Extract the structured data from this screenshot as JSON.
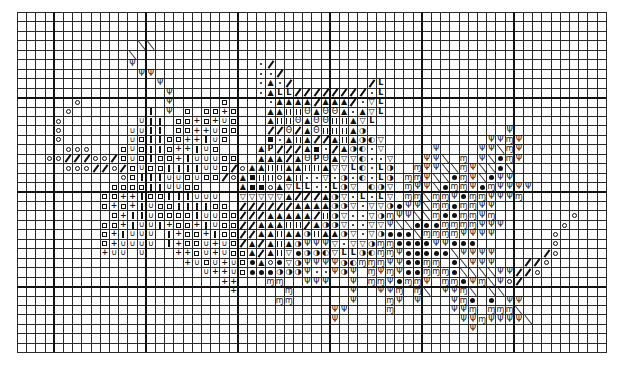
{
  "chart": {
    "title": "",
    "grid": {
      "cols": 64,
      "rows": 36,
      "cell_width": 9.2,
      "cell_height": 9.45,
      "thick_cols": [
        4,
        14,
        24,
        34,
        44,
        54
      ],
      "thick_rows": [
        9,
        19,
        29
      ],
      "line_color": "#2a2a2a",
      "thick_line_color": "#111111",
      "background": "#ffffff"
    },
    "legend": {
      "o": {
        "name": "open-circle",
        "glyph": "",
        "shape": "circle"
      },
      "/": {
        "name": "thick-slash",
        "glyph": "",
        "shape": "slash"
      },
      "x": {
        "name": "back-stitch-diagonal",
        "glyph": "",
        "shape": "bslash"
      },
      "v": {
        "name": "psi-arrow",
        "glyph": "Ψ"
      },
      "q": {
        "name": "open-square",
        "glyph": "",
        "shape": "square"
      },
      "+": {
        "name": "plus",
        "glyph": "+"
      },
      "|": {
        "name": "vertical-bar",
        "glyph": "",
        "shape": "bar"
      },
      "u": {
        "name": "cup-u",
        "glyph": "∪"
      },
      "a": {
        "name": "filled-triangle",
        "glyph": "▲"
      },
      "t": {
        "name": "open-triangle-down",
        "glyph": "▽"
      },
      "L": {
        "name": "corner-l",
        "glyph": "L"
      },
      "d": {
        "name": "dot",
        "glyph": "",
        "shape": "dot"
      },
      "h": {
        "name": "double-bar",
        "glyph": "",
        "shape": "double"
      },
      "O": {
        "name": "ringed-o",
        "glyph": "Θ"
      },
      "s": {
        "name": "filled-square",
        "glyph": "",
        "shape": "fsquare"
      },
      "p": {
        "name": "letter-p",
        "glyph": "P"
      },
      "b": {
        "name": "half-circle-right",
        "glyph": "◑"
      },
      "e": {
        "name": "half-circle-left",
        "glyph": "◐"
      },
      "m": {
        "name": "curly-m",
        "glyph": "ɱ"
      },
      "k": {
        "name": "filled-circle",
        "glyph": "",
        "shape": "fcircle"
      }
    },
    "rows": {
      "3": "13x 14x",
      "4": "12x",
      "5": "12v 26d 27/",
      "6": "13v 14v 26d 27d 28/",
      "7": "15v 26d 27a 28d 29/ 38/ 39L",
      "8": "16v 26d 27a 28L 29L 30/ 31/ 32/ 33/ 34/ 35/ 36/ 37/ 38d 39L",
      "9": "6o 16v 22q 27d 28a 29a 30a 31a 32/ 33a 34a 35a 36/ 37d 38t 39L",
      "10": "5o 14| 16v 18q 20q 21q 22+ 23q 27a 28a 29h 30h 31O 32a 33O 34O 35a 36d 37a 38t 39L",
      "11": "4o 13u 14| 15| 17q 18q 19+ 20q 21+ 22u 23q 27a 28h 29h 30O 31a 32O 33O 34h 35h 36a 37t 38L",
      "12": "4o 12u 13u 14| 15| 17q 18q 19+ 20+ 21u 22q 23q 27/ 28/ 29O 30/ 31a 32O 33h 34h 35h 36a 37b 53v",
      "13": "4o 12u 13q 14| 15| 16q 17q 18+ 19+ 20| 21u 22q 27s 28d 29a 30h 31a 32/ 33/ 34a 35h 36a 37b 38e 39t 51v 52v 53m 54v",
      "14": "5o 6o 7o 11q 12u 13q 14| 15| 16q 17+ 18+ 19| 20u 21q 26a 27p 28/ 29/ 30/ 31a 32s 33d 34/ 35a 36b 37e 38d 39t 45v 50v 51v 52x 53m 54v",
      "15": "3o 4o 5/ 6/ 7/ 8o 9o 10/ 11q 12u 13q 14| 15q 16q 17+ 18| 19u 20u 21u 22q 23q 26a 27a 28a 29/ 30a 31O 32p 33O 34a 35t 36t 37e 38d 39d 40t 44v 45v 46x 48m 50v 51x 52k 53m 54v",
      "16": "5o 6o 7o 8/ 9/ 10o 11/ 12q 13u 14q 15q 16| 17| 18| 19| 20u 21u 22q 23/ 24o 25a 26a 27h 28h 29a 30a 31h 32h 33a 34t 35t 36L 37e 38d 39L 40b 43m 44v 45v 46x 47x 48m 49v 50x 51x 52k 53x",
      "17": "11o 12q 13| 14| 15| 16u 17u 18q 19u 20q 21q 22/ 23o 24a 25s 26h 27h 28o 29a 30h 31d 32d 33t 34d 35b 36d 37e 38d 39L 40b 42m 43m 44v 45x 46x 47k 48m 49v 50x 51k 52v 53v",
      "18": "10q 11q 12q 13q 14| 15| 16u 17u 18q 19q 24a 25s 26s 27o 28a 29t 30L 31L 32d 33d 34L 35b 36t 38e 39b 40t 42m 43v 44v 45x 46k 47m 48m 49v 50k 51m 52v 53v 54v 55v",
      "19": "9q 10q 11+ 12+ 13| 14q 15q 16| 17| 18| 19u 20u 21u 24t 25t 26t 27t 28t 29a 30/ 31/ 32/ 33a 34b 35t 36d 37L 38d 39L 40t 42m 43m 44x 45m 46m 47v 48k 49m 50m 51v 52v 53v 54m",
      "20": "9q 10+ 11q 12+ 13| 14u 15q 16q 17| 18| 19| 20| 21q 22q 24/ 25/ 26/ 27/ 28/ 29/ 30a 31a 32a 33a 34b 35b 36t 37d 38t 39t 40b 41k 42v 43v 44x 45m 46m 47k 48m 49m 50v 51v",
      "21": "10q 11+ 12| 13| 14u 15q 16q 17q 18q 19| 20u 21u 22q 23q 24/ 25/ 26/ 27a 28a 29a 30a 31a 32/ 33h 34b 35t 36d 37d 38t 39b 40m 41v 42v 43x 44x 45m 46k 47k 48m 49m 50v 51m 60o",
      "22": "9q 10q 11+ 12| 13u 14u 15| 16+ 17q 18q 19+ 20| 21u 22q 23q 24/ 25/ 26a 27a 28a 29h 30h 31/ 32a 33b 34b 35t 36d 37d 38t 39t 40v 41x 42x 43k 44k 45k 46m 47m 48m 49m 50v 51v 52v 59o",
      "23": "9q 10+ 11| 12u 13u 14u 16| 17+ 18q 19q 20+ 21| 22q 23q 24/ 25/ 26a 27a 28h 29a 30a 31b 32h 33a 34a 35b 36t 37d 38t 39b 40k 41k 42k 43x 44m 45m 46m 47m 48v 49v 50v 51v 58o",
      "24": "9q 10+ 11u 12u 13u 14u 16| 17+ 18q 19q 20u 21+ 22u 23q 24/ 25a 26/ 27a 28h 29a 30b 31v 32v 33v 34t 35d 36t 37t 38b 39m 40m 41k 42k 43k 44k 45v 46v 47k 48k 49k 58o",
      "25": "9+ 10u 11u 13u 17+ 18+ 19q 20u 21+ 22u 23q 24q 25a 26/ 27a 28h 29t 30k 31b 32b 33e 34t 35L 36L 37b 38e 39m 40m 41v 42k 43k 44k 45k 46k 47x 48v 49v 50v 51v 57/ 58o",
      "26": "18+ 19u 20q 21u 22+ 23u 24q 25k 26a 27o 28k 29t 30b 31v 32v 33v 34v 35b 36e 37m 38m 39m 40v 41v 42k 43k 44m 45m 47k 48x 49v 50v 51v 55/ 56/ 57o",
      "27": "20u 21+ 22+ 23u 24q 25k 26k 27k 28b 29b 30b 31v 32d 33d 34v 35b 36v 38m 39v 40m 41v 42k 43k 44m 45m 46m 47k 48x 49x 50x 51x 52v 53v 54/ 55/ 56o",
      "28": "22+ 23+ 27m 28m 31v 32v 33v 36v 38m 39m 40v 41k 42m 43m 44v 46m 47m 48k 49v 50m 51x 52v 53o 54/",
      "29": "23+ 29m 36v 39v 40v 41m 43m 44x 46v 47v 48m 49x 51x 52x",
      "30": "28m 29m 36v 40m 41v 43v 47v 48m 49k 51k 53v 54v",
      "31": "34v 35v 40m 47v 48v 49m 51m 52m 53m 54x",
      "32": "34v 48v 49v 50m 51v 52v 53v 54v 55x",
      "33": "49v"
    }
  }
}
